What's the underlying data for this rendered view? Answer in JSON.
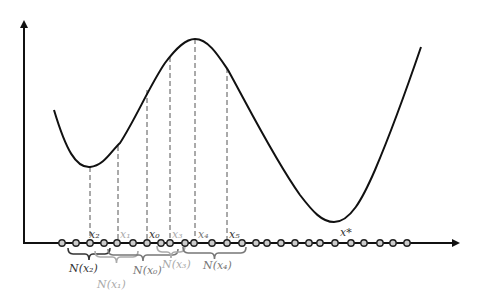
{
  "diagram": {
    "colors": {
      "curve": "#111111",
      "axis": "#111111",
      "dashed": "#555555",
      "dark_label": "#333333",
      "mid_label": "#777777",
      "light_label": "#aaaaaa"
    },
    "axes": {
      "origin": [
        24,
        243
      ],
      "y_top": 18,
      "x_right": 462
    },
    "curve_path": "M54,110 C66,150 76,168 90,167 C104,166 112,150 120,143 C135,120 150,85 165,63 C177,47 186,39 195,39 C208,39 218,55 228,70 C250,110 275,160 300,195 C313,212 322,222 334,222 C350,222 362,200 375,170 C392,130 408,85 421,47",
    "axis_points_x": [
      62,
      76,
      90,
      104,
      117,
      133,
      147,
      161,
      170,
      185,
      194,
      212,
      227,
      242,
      256,
      267,
      281,
      295,
      309,
      320,
      335,
      351,
      364,
      380,
      393,
      407
    ],
    "dashed_lines": [
      {
        "x": 90,
        "y_top": 167
      },
      {
        "x": 118,
        "y_top": 146
      },
      {
        "x": 147,
        "y_top": 90
      },
      {
        "x": 170,
        "y_top": 57
      },
      {
        "x": 195,
        "y_top": 39
      },
      {
        "x": 227,
        "y_top": 68
      }
    ],
    "point_labels": [
      {
        "text": "x₂",
        "x": 89,
        "y": 238,
        "tone": "dark"
      },
      {
        "text": "x₁",
        "x": 120,
        "y": 238,
        "tone": "light"
      },
      {
        "text": "x₀",
        "x": 149,
        "y": 238,
        "tone": "dark"
      },
      {
        "text": "x₃",
        "x": 172,
        "y": 238,
        "tone": "light"
      },
      {
        "text": "x₄",
        "x": 198,
        "y": 238,
        "tone": "mid"
      },
      {
        "text": "x₅",
        "x": 229,
        "y": 238,
        "tone": "dark"
      },
      {
        "text": "x*",
        "x": 340,
        "y": 236,
        "tone": "dark"
      }
    ],
    "neighborhoods": [
      {
        "label": "N(x₂)",
        "x1": 68,
        "x2": 110,
        "y": 248,
        "label_x": 69,
        "label_y": 272,
        "tone": "dark"
      },
      {
        "label": "N(x₁)",
        "x1": 95,
        "x2": 138,
        "y": 251,
        "label_x": 97,
        "label_y": 288,
        "tone": "light"
      },
      {
        "label": "N(x₀)",
        "x1": 108,
        "x2": 178,
        "y": 249,
        "label_x": 133,
        "label_y": 274,
        "tone": "mid"
      },
      {
        "label": "N(x₃)",
        "x1": 157,
        "x2": 185,
        "y": 246,
        "label_x": 162,
        "label_y": 268,
        "tone": "light"
      },
      {
        "label": "N(x₄)",
        "x1": 183,
        "x2": 246,
        "y": 247,
        "label_x": 203,
        "label_y": 269,
        "tone": "mid"
      }
    ]
  }
}
